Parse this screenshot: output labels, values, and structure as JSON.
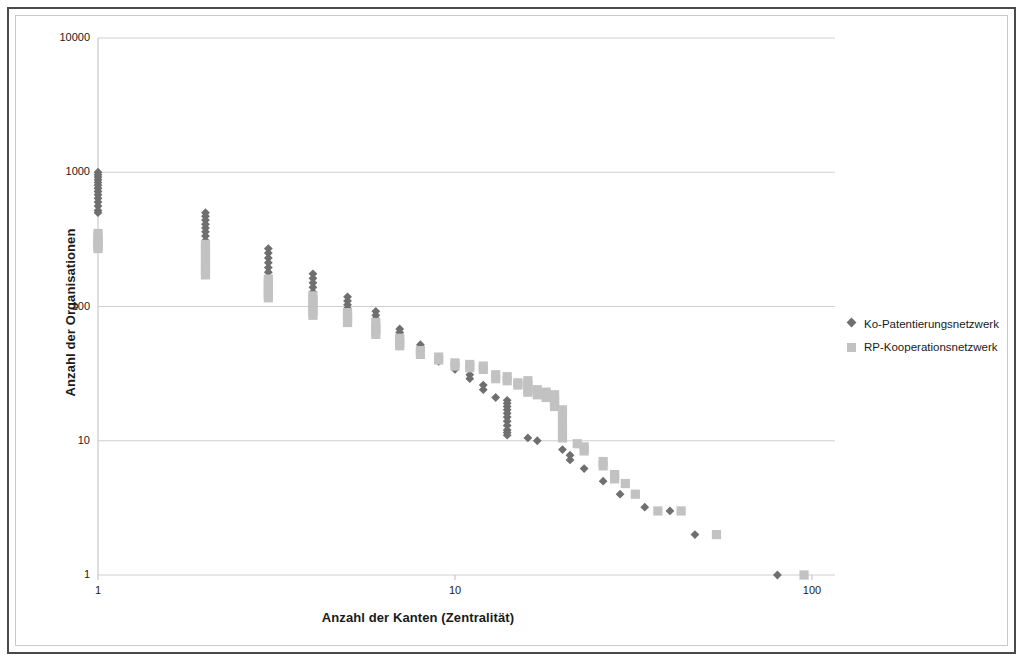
{
  "chart_data": {
    "type": "scatter",
    "title": "",
    "xlabel": "Anzahl der Kanten (Zentralität)",
    "ylabel": "Anzahl der Organisationen",
    "xscale": "log",
    "yscale": "log",
    "xlim": [
      1,
      100
    ],
    "ylim": [
      1,
      10000
    ],
    "xticks": [
      1,
      10,
      100
    ],
    "xtick_labels": [
      "1",
      "10",
      "100"
    ],
    "yticks": [
      1,
      10,
      100,
      1000,
      10000
    ],
    "ytick_labels": [
      "1",
      "10",
      "100",
      "1000",
      "10000"
    ],
    "grid": "horizontal",
    "legend_position": "right",
    "series": [
      {
        "name": "Ko-Patentierungsnetzwerk",
        "marker": "diamond",
        "color": "#6f6f6f",
        "points": [
          [
            1,
            1000
          ],
          [
            1,
            960
          ],
          [
            1,
            920
          ],
          [
            1,
            880
          ],
          [
            1,
            840
          ],
          [
            1,
            800
          ],
          [
            1,
            760
          ],
          [
            1,
            720
          ],
          [
            1,
            680
          ],
          [
            1,
            640
          ],
          [
            1,
            600
          ],
          [
            1,
            560
          ],
          [
            1,
            520
          ],
          [
            1,
            500
          ],
          [
            2,
            500
          ],
          [
            2,
            470
          ],
          [
            2,
            440
          ],
          [
            2,
            410
          ],
          [
            2,
            385
          ],
          [
            2,
            360
          ],
          [
            2,
            335
          ],
          [
            2,
            310
          ],
          [
            2,
            290
          ],
          [
            3,
            270
          ],
          [
            3,
            250
          ],
          [
            3,
            230
          ],
          [
            3,
            212
          ],
          [
            3,
            195
          ],
          [
            3,
            180
          ],
          [
            3,
            165
          ],
          [
            4,
            175
          ],
          [
            4,
            162
          ],
          [
            4,
            150
          ],
          [
            4,
            139
          ],
          [
            4,
            128
          ],
          [
            4,
            120
          ],
          [
            5,
            118
          ],
          [
            5,
            110
          ],
          [
            5,
            103
          ],
          [
            5,
            97
          ],
          [
            6,
            92
          ],
          [
            6,
            86
          ],
          [
            6,
            81
          ],
          [
            7,
            68
          ],
          [
            7,
            64
          ],
          [
            7,
            60
          ],
          [
            7,
            56
          ],
          [
            8,
            52
          ],
          [
            8,
            49
          ],
          [
            8,
            46
          ],
          [
            9,
            41
          ],
          [
            9,
            39
          ],
          [
            10,
            36
          ],
          [
            10,
            34
          ],
          [
            11,
            31
          ],
          [
            11,
            29
          ],
          [
            12,
            26
          ],
          [
            12,
            24
          ],
          [
            13,
            21
          ],
          [
            14,
            20
          ],
          [
            14,
            19
          ],
          [
            14,
            18
          ],
          [
            14,
            17
          ],
          [
            14,
            16
          ],
          [
            14,
            15
          ],
          [
            14,
            14
          ],
          [
            14,
            13
          ],
          [
            14,
            12
          ],
          [
            14,
            11.5
          ],
          [
            14,
            11
          ],
          [
            16,
            10.5
          ],
          [
            17,
            10
          ],
          [
            20,
            8.6
          ],
          [
            21,
            7.8
          ],
          [
            21,
            7.2
          ],
          [
            23,
            6.2
          ],
          [
            26,
            5.0
          ],
          [
            29,
            4.0
          ],
          [
            34,
            3.2
          ],
          [
            40,
            3.0
          ],
          [
            47,
            2.0
          ],
          [
            80,
            1.0
          ]
        ]
      },
      {
        "name": "RP-Kooperationsnetzwerk",
        "marker": "square",
        "color": "#c2c2c2",
        "points": [
          [
            1,
            350
          ],
          [
            1,
            330
          ],
          [
            1,
            312
          ],
          [
            1,
            295
          ],
          [
            1,
            280
          ],
          [
            1,
            270
          ],
          [
            2,
            290
          ],
          [
            2,
            270
          ],
          [
            2,
            250
          ],
          [
            2,
            232
          ],
          [
            2,
            215
          ],
          [
            2,
            200
          ],
          [
            2,
            186
          ],
          [
            2,
            172
          ],
          [
            3,
            160
          ],
          [
            3,
            150
          ],
          [
            3,
            140
          ],
          [
            3,
            131
          ],
          [
            3,
            123
          ],
          [
            3,
            116
          ],
          [
            4,
            120
          ],
          [
            4,
            112
          ],
          [
            4,
            105
          ],
          [
            4,
            98
          ],
          [
            4,
            92
          ],
          [
            4,
            86
          ],
          [
            5,
            90
          ],
          [
            5,
            85
          ],
          [
            5,
            80
          ],
          [
            5,
            76
          ],
          [
            6,
            76
          ],
          [
            6,
            70
          ],
          [
            6,
            66
          ],
          [
            6,
            62
          ],
          [
            7,
            58
          ],
          [
            7,
            54
          ],
          [
            7,
            51
          ],
          [
            8,
            47
          ],
          [
            8,
            44
          ],
          [
            9,
            42
          ],
          [
            9,
            40
          ],
          [
            10,
            38
          ],
          [
            10,
            36
          ],
          [
            11,
            37
          ],
          [
            11,
            35
          ],
          [
            12,
            36
          ],
          [
            12,
            34
          ],
          [
            13,
            31
          ],
          [
            13,
            29
          ],
          [
            14,
            30
          ],
          [
            14,
            28
          ],
          [
            15,
            27
          ],
          [
            15,
            26
          ],
          [
            16,
            28
          ],
          [
            16,
            26
          ],
          [
            16,
            24
          ],
          [
            16,
            23
          ],
          [
            17,
            24
          ],
          [
            17,
            22
          ],
          [
            18,
            23
          ],
          [
            18,
            22
          ],
          [
            18,
            21
          ],
          [
            19,
            22
          ],
          [
            19,
            21
          ],
          [
            19,
            20
          ],
          [
            19,
            19
          ],
          [
            19,
            18
          ],
          [
            20,
            17
          ],
          [
            20,
            15
          ],
          [
            20,
            13
          ],
          [
            20,
            11.5
          ],
          [
            20,
            10.5
          ],
          [
            22,
            9.5
          ],
          [
            23,
            9.0
          ],
          [
            23,
            8.4
          ],
          [
            26,
            7.0
          ],
          [
            26,
            6.5
          ],
          [
            28,
            5.6
          ],
          [
            28,
            5.2
          ],
          [
            30,
            4.8
          ],
          [
            32,
            4.0
          ],
          [
            37,
            3.0
          ],
          [
            43,
            3.0
          ],
          [
            54,
            2.0
          ],
          [
            95,
            1.0
          ]
        ]
      }
    ]
  },
  "axes": {
    "x_title": "Anzahl der Kanten (Zentralität)",
    "y_title": "Anzahl der Organisationen"
  },
  "legend": {
    "items": [
      {
        "label": "Ko-Patentierungsnetzwerk",
        "marker": "diamond"
      },
      {
        "label": "RP-Kooperationsnetzwerk",
        "marker": "square"
      }
    ]
  },
  "colors": {
    "series_1": "#6f6f6f",
    "series_2": "#c2c2c2",
    "gridline": "#d0d0d0",
    "axis": "#bdbdbd",
    "text": "#1a1a1a",
    "outer_frame": "#4a4a4a",
    "inner_frame": "#c9c9c9"
  }
}
